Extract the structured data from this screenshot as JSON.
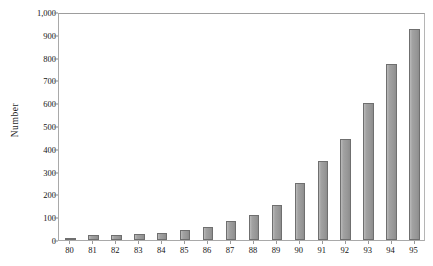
{
  "chart_data": {
    "type": "bar",
    "title": "",
    "subtitle": "",
    "xlabel": "",
    "ylabel": "Number",
    "categories": [
      "80",
      "81",
      "82",
      "83",
      "84",
      "85",
      "86",
      "87",
      "88",
      "89",
      "90",
      "91",
      "92",
      "93",
      "94",
      "95"
    ],
    "values": [
      8,
      20,
      22,
      25,
      32,
      42,
      58,
      85,
      110,
      155,
      250,
      345,
      445,
      600,
      770,
      925
    ],
    "ylim": [
      0,
      1000
    ],
    "ytick_values": [
      0,
      100,
      200,
      300,
      400,
      500,
      600,
      700,
      800,
      900,
      1000
    ],
    "ytick_labels": [
      "0",
      "100",
      "200",
      "300",
      "400",
      "500",
      "600",
      "700",
      "800",
      "900",
      "1,000"
    ],
    "grid": false,
    "legend": null,
    "legend_position": "none",
    "series": [
      {
        "name": "Number",
        "values": [
          8,
          20,
          22,
          25,
          32,
          42,
          58,
          85,
          110,
          155,
          250,
          345,
          445,
          600,
          770,
          925
        ]
      }
    ],
    "colors": {
      "bar_fill": "#9d9d9d",
      "bar_stroke": "#6f6f6f",
      "axis": "#a9a9a9",
      "text": "#141414",
      "background": "#ffffff"
    }
  }
}
